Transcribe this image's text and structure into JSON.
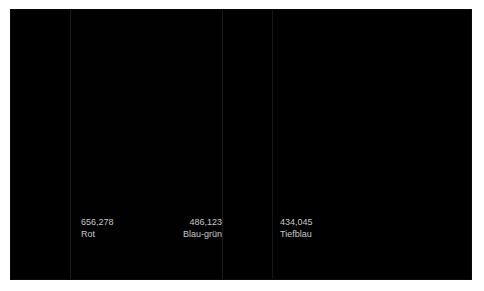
{
  "panel": {
    "background_color": "#000000",
    "border_color": "#0a0a0a",
    "canvas_color": "#ffffff"
  },
  "bands": [
    {
      "name": "band-left-black",
      "color": "#000000"
    },
    {
      "name": "band-rot",
      "color": "#010101"
    },
    {
      "name": "band-blau-gruen",
      "color": "#000000"
    },
    {
      "name": "band-tiefblau",
      "color": "#000000"
    }
  ],
  "dividers": [
    {
      "name": "divider-1",
      "color": "#1b1b1b"
    },
    {
      "name": "divider-2",
      "color": "#1b1b1b"
    },
    {
      "name": "divider-3",
      "color": "#151515"
    }
  ],
  "annotations": [
    {
      "value": "656,278",
      "name": "Rot"
    },
    {
      "value": "486,123",
      "name": "Blau-grün"
    },
    {
      "value": "434,045",
      "name": "Tiefblau"
    }
  ],
  "text": {
    "color": "#c8c8c8"
  }
}
